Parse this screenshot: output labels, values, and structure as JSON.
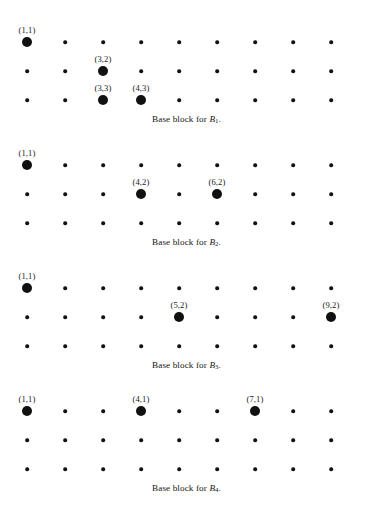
{
  "figure": {
    "type": "dot-lattice-diagram",
    "grid": {
      "columns": 9,
      "rows": 3,
      "origin_x": 27,
      "origin_y": 0,
      "col_spacing": 38,
      "row_spacing": 29,
      "dot_color": "#111111",
      "small_dot_diameter": 3.6,
      "large_dot_diameter": 10
    },
    "blocks": [
      {
        "id": "block-1",
        "top": 35,
        "caption_top": 113,
        "caption_prefix": "Base block for ",
        "caption_var": "B",
        "caption_sub": "1",
        "caption_suffix": ".",
        "caption_text": "Base block for B1.",
        "marked": [
          {
            "label": "(1,1)",
            "col": 1,
            "row": 1
          },
          {
            "label": "(3,2)",
            "col": 3,
            "row": 2
          },
          {
            "label": "(3,3)",
            "col": 3,
            "row": 3
          },
          {
            "label": "(4,3)",
            "col": 4,
            "row": 3
          }
        ]
      },
      {
        "id": "block-2",
        "top": 158,
        "caption_top": 236,
        "caption_prefix": "Base block for ",
        "caption_var": "B",
        "caption_sub": "2",
        "caption_suffix": ".",
        "caption_text": "Base block for B2.",
        "marked": [
          {
            "label": "(1,1)",
            "col": 1,
            "row": 1
          },
          {
            "label": "(4,2)",
            "col": 4,
            "row": 2
          },
          {
            "label": "(6,2)",
            "col": 6,
            "row": 2
          }
        ]
      },
      {
        "id": "block-3",
        "top": 281,
        "caption_top": 359,
        "caption_prefix": "Base block for ",
        "caption_var": "B",
        "caption_sub": "3",
        "caption_suffix": ".",
        "caption_text": "Base block for B3.",
        "marked": [
          {
            "label": "(1,1)",
            "col": 1,
            "row": 1
          },
          {
            "label": "(5,2)",
            "col": 5,
            "row": 2
          },
          {
            "label": "(9,2)",
            "col": 9,
            "row": 2
          }
        ]
      },
      {
        "id": "block-4",
        "top": 404,
        "caption_top": 482,
        "caption_prefix": "Base block for ",
        "caption_var": "B",
        "caption_sub": "4",
        "caption_suffix": ".",
        "caption_text": "Base block for B4.",
        "marked": [
          {
            "label": "(1,1)",
            "col": 1,
            "row": 1
          },
          {
            "label": "(4,1)",
            "col": 4,
            "row": 1
          },
          {
            "label": "(7,1)",
            "col": 7,
            "row": 1
          }
        ]
      }
    ]
  }
}
